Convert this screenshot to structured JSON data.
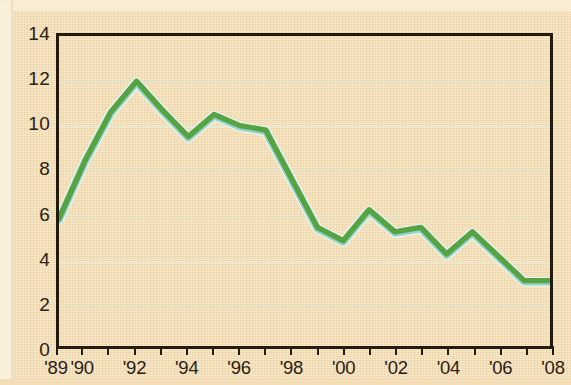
{
  "chart_data": {
    "type": "line",
    "title": "",
    "subtitle": "",
    "xlabel": "",
    "ylabel": "",
    "x": [
      1989,
      1990,
      1991,
      1992,
      1993,
      1994,
      1995,
      1996,
      1997,
      1998,
      1999,
      2000,
      2001,
      2002,
      2003,
      2004,
      2005,
      2006,
      2007,
      2008
    ],
    "values": [
      5.7,
      8.3,
      10.5,
      11.9,
      10.6,
      9.4,
      10.4,
      9.9,
      9.7,
      7.5,
      5.3,
      4.7,
      6.1,
      5.1,
      5.3,
      4.1,
      5.1,
      4.0,
      2.9,
      2.9
    ],
    "series": [
      {
        "name": "series-1",
        "color": "#57a343",
        "values": [
          5.7,
          8.3,
          10.5,
          11.9,
          10.6,
          9.4,
          10.4,
          9.9,
          9.7,
          7.5,
          5.3,
          4.7,
          6.1,
          5.1,
          5.3,
          4.1,
          5.1,
          4.0,
          2.9,
          2.9
        ]
      }
    ],
    "xlim": [
      1989,
      2008
    ],
    "ylim": [
      0,
      14
    ],
    "y_ticks": [
      0,
      2,
      4,
      6,
      8,
      10,
      12,
      14
    ],
    "y_tick_labels": [
      "0",
      "2",
      "4",
      "6",
      "8",
      "10",
      "12",
      "14"
    ],
    "x_ticks": [
      1989,
      1990,
      1991,
      1992,
      1993,
      1994,
      1995,
      1996,
      1997,
      1998,
      1999,
      2000,
      2001,
      2002,
      2003,
      2004,
      2005,
      2006,
      2007,
      2008
    ],
    "x_tick_labels": [
      {
        "x": 1989,
        "label": "'89"
      },
      {
        "x": 1990,
        "label": "'90"
      },
      {
        "x": 1992,
        "label": "'92"
      },
      {
        "x": 1994,
        "label": "'94"
      },
      {
        "x": 1996,
        "label": "'96"
      },
      {
        "x": 1998,
        "label": "'98"
      },
      {
        "x": 2000,
        "label": "'00"
      },
      {
        "x": 2002,
        "label": "'02"
      },
      {
        "x": 2004,
        "label": "'04"
      },
      {
        "x": 2006,
        "label": "'06"
      },
      {
        "x": 2008,
        "label": "'08"
      }
    ],
    "grid": "horizontal",
    "legend": "none",
    "annotations": [],
    "colors": {
      "background": "#f6e2bc",
      "frame": "#231a10",
      "gridline": "#d6ecdf",
      "line": "#57a343",
      "line_highlight": "#8fd0c7",
      "text": "#2a2016"
    }
  }
}
